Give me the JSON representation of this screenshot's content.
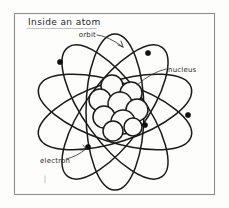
{
  "page": {
    "background_color": "#fdfdfc",
    "medium": "hand-drawn pencil sketch"
  },
  "frame": {
    "name": "drawing-border",
    "stroke_color": "#8d8d8d",
    "x": 14,
    "y": 13,
    "width": 201,
    "height": 182
  },
  "title": {
    "text": "Inside an atom",
    "x": 28,
    "y": 25
  },
  "diagram": {
    "subject": "atom",
    "ink_color": "#1a1a1a",
    "center": {
      "x": 115,
      "y": 112
    },
    "nucleus": {
      "label": "nucleus",
      "fill_color": "#fbfbfa",
      "nucleon_count": 9,
      "nucleons": [
        {
          "cx": 112,
          "cy": 86,
          "r": 11
        },
        {
          "cx": 131,
          "cy": 93,
          "r": 11
        },
        {
          "cx": 100,
          "cy": 100,
          "r": 11
        },
        {
          "cx": 120,
          "cy": 104,
          "r": 12
        },
        {
          "cx": 137,
          "cy": 110,
          "r": 11
        },
        {
          "cx": 104,
          "cy": 117,
          "r": 11
        },
        {
          "cx": 123,
          "cy": 122,
          "r": 12
        },
        {
          "cx": 113,
          "cy": 131,
          "r": 10
        },
        {
          "cx": 133,
          "cy": 127,
          "r": 9
        }
      ]
    },
    "orbits": {
      "label": "orbit",
      "count": 5,
      "ellipses": [
        {
          "rx": 80,
          "ry": 30,
          "rotation": 18
        },
        {
          "rx": 80,
          "ry": 30,
          "rotation": 54
        },
        {
          "rx": 78,
          "ry": 29,
          "rotation": 90
        },
        {
          "rx": 80,
          "ry": 30,
          "rotation": 126
        },
        {
          "rx": 80,
          "ry": 30,
          "rotation": 162
        }
      ]
    },
    "electrons": {
      "label": "electron",
      "count": 5,
      "dots": [
        {
          "cx": 60,
          "cy": 62,
          "r": 2.6
        },
        {
          "cx": 148,
          "cy": 53,
          "r": 2.6
        },
        {
          "cx": 188,
          "cy": 115,
          "r": 2.6
        },
        {
          "cx": 145,
          "cy": 125,
          "r": 2.6
        },
        {
          "cx": 88,
          "cy": 147,
          "r": 2.6
        }
      ]
    }
  },
  "labels": [
    {
      "id": "orbit",
      "text": "orbit",
      "text_x": 96,
      "text_y": 37,
      "leader_from": {
        "x": 112,
        "y": 38
      },
      "leader_to": {
        "x": 124,
        "y": 48
      }
    },
    {
      "id": "nucleus",
      "text": "nucleus",
      "text_x": 168,
      "text_y": 72,
      "leader_from": {
        "x": 166,
        "y": 70
      },
      "leader_to": {
        "x": 136,
        "y": 86
      }
    },
    {
      "id": "electron",
      "text": "electron",
      "text_x": 40,
      "text_y": 163,
      "leader_from": {
        "x": 66,
        "y": 159
      },
      "leader_to": {
        "x": 86,
        "y": 149
      }
    }
  ]
}
